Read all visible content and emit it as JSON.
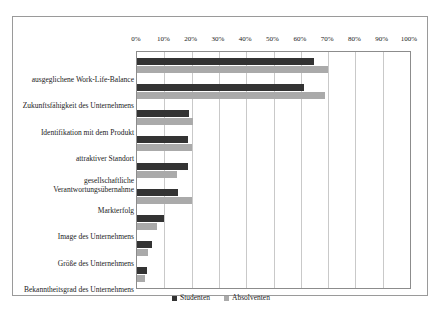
{
  "chart_data": {
    "type": "bar",
    "orientation": "horizontal",
    "title": "",
    "xlabel": "",
    "ylabel": "",
    "xlim": [
      0,
      100
    ],
    "grid": true,
    "legend_position": "bottom",
    "tick_labels": [
      "0%",
      "10%",
      "20%",
      "30%",
      "40%",
      "50%",
      "60%",
      "70%",
      "80%",
      "90%",
      "100%"
    ],
    "tick_values": [
      0,
      10,
      20,
      30,
      40,
      50,
      60,
      70,
      80,
      90,
      100
    ],
    "categories": [
      "ausgeglichene Work-Life-Balance",
      "Zukunftsfähigkeit des Unternehmens",
      "Identifikation mit dem Produkt",
      "attraktiver Standort",
      "gesellschaftliche Verantwortungsübernahme",
      "Markterfolg",
      "Image des Unternehmens",
      "Größe des Unternehmens",
      "Bekanntheitsgrad des Unternehmens"
    ],
    "series": [
      {
        "name": "Studenten",
        "color": "#333333",
        "values": [
          65,
          61,
          19,
          18.5,
          18.5,
          15,
          10,
          5.5,
          3.5
        ]
      },
      {
        "name": "Absolventen",
        "color": "#aaaaaa",
        "values": [
          70,
          69,
          20.5,
          20,
          14.5,
          20,
          7.5,
          4,
          3
        ]
      }
    ]
  }
}
